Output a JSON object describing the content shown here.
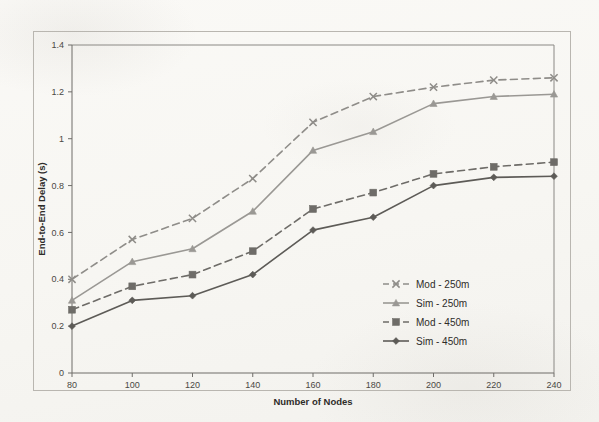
{
  "figure": {
    "background_color": "#fbfaf8",
    "frame_color": "#b9b6b0"
  },
  "chart_data": {
    "type": "line",
    "title": "",
    "xlabel": "Number of Nodes",
    "ylabel": "End-to-End Delay (s)",
    "x": [
      80,
      100,
      120,
      140,
      160,
      180,
      200,
      220,
      240
    ],
    "xtick_labels": [
      "80",
      "100",
      "120",
      "140",
      "160",
      "180",
      "200",
      "220",
      "240"
    ],
    "ytick_labels": [
      "0",
      "0.2",
      "0.4",
      "0.6",
      "0.8",
      "1",
      "1.2",
      "1.4"
    ],
    "yticks": [
      0,
      0.2,
      0.4,
      0.6,
      0.8,
      1,
      1.2,
      1.4
    ],
    "xlim": [
      80,
      240
    ],
    "ylim": [
      0,
      1.4
    ],
    "grid": false,
    "legend_position": "lower-right",
    "series": [
      {
        "name": "Mod - 250m",
        "values": [
          0.4,
          0.57,
          0.66,
          0.83,
          1.07,
          1.18,
          1.22,
          1.25,
          1.26
        ],
        "style": "dashed",
        "marker": "cross",
        "color": "#8f8d89"
      },
      {
        "name": "Sim - 250m",
        "values": [
          0.31,
          0.475,
          0.53,
          0.69,
          0.95,
          1.03,
          1.15,
          1.18,
          1.19
        ],
        "style": "solid",
        "marker": "triangle",
        "color": "#9a9894"
      },
      {
        "name": "Mod - 450m",
        "values": [
          0.27,
          0.37,
          0.42,
          0.52,
          0.7,
          0.77,
          0.85,
          0.88,
          0.9
        ],
        "style": "dashed",
        "marker": "square",
        "color": "#6e6c68"
      },
      {
        "name": "Sim - 450m",
        "values": [
          0.2,
          0.31,
          0.33,
          0.42,
          0.61,
          0.665,
          0.8,
          0.835,
          0.84
        ],
        "style": "solid",
        "marker": "diamond",
        "color": "#5d5b57"
      }
    ]
  }
}
